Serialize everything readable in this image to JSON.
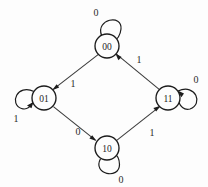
{
  "diagram": {
    "type": "state-transition-diagram",
    "background_color": "#fdfdfd",
    "stroke_color": "#1c1c1c",
    "states": [
      {
        "id": "s00",
        "label": "00",
        "cx": 107,
        "cy": 46,
        "r": 12
      },
      {
        "id": "s01",
        "label": "01",
        "cx": 44,
        "cy": 98,
        "r": 12
      },
      {
        "id": "s11",
        "label": "11",
        "cx": 168,
        "cy": 98,
        "r": 12
      },
      {
        "id": "s10",
        "label": "10",
        "cx": 107,
        "cy": 148,
        "r": 12
      }
    ],
    "self_loops": [
      {
        "id": "loop-00",
        "state": "00",
        "label": "0",
        "position": "top",
        "label_x": 96,
        "label_y": 12
      },
      {
        "id": "loop-01",
        "state": "01",
        "label": "1",
        "position": "left",
        "label_x": 16,
        "label_y": 118
      },
      {
        "id": "loop-11",
        "state": "11",
        "label": "0",
        "position": "right",
        "label_x": 196,
        "label_y": 79
      },
      {
        "id": "loop-10",
        "state": "10",
        "label": "0",
        "position": "bottom",
        "label_x": 121,
        "label_y": 179
      }
    ],
    "transitions": [
      {
        "id": "t-00-01",
        "from": "00",
        "to": "01",
        "label": "1",
        "label_x": 73,
        "label_y": 83
      },
      {
        "id": "t-01-10",
        "from": "01",
        "to": "10",
        "label": "0",
        "label_x": 78,
        "label_y": 131
      },
      {
        "id": "t-10-11",
        "from": "10",
        "to": "11",
        "label": "1",
        "label_x": 152,
        "label_y": 132
      },
      {
        "id": "t-11-00",
        "from": "11",
        "to": "00",
        "label": "1",
        "label_x": 139,
        "label_y": 59
      }
    ]
  }
}
